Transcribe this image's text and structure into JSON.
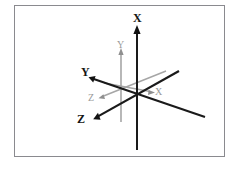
{
  "figure": {
    "background_color": "#ffffff",
    "frame": {
      "border_color": "#8a8a8f",
      "fill_color": "#ffffff"
    },
    "colors": {
      "primary_axis": "#151515",
      "secondary_axis": "#a6a6a6",
      "primary_label": "#151515",
      "secondary_label": "#9a9a9a"
    },
    "origin": {
      "x": 137,
      "y": 90
    },
    "frames": [
      {
        "name": "primary-frame",
        "style": "solid-black-bold",
        "axes": [
          {
            "label": "X",
            "label_x": 133,
            "label_y": 12,
            "direction": "up",
            "arrow_tip": {
              "x": 137,
              "y": 27
            },
            "tail": {
              "x": 137,
              "y": 150
            },
            "arrow": true
          },
          {
            "label": "Y",
            "label_x": 81,
            "label_y": 66,
            "direction": "upper-left",
            "arrow_tip": {
              "x": 90,
              "y": 78
            },
            "tail": {
              "x": 205,
              "y": 117
            },
            "arrow": true
          },
          {
            "label": "Z",
            "label_x": 77,
            "label_y": 114,
            "direction": "lower-left",
            "arrow_tip": {
              "x": 95,
              "y": 118
            },
            "tail": {
              "x": 178,
              "y": 72
            },
            "arrow": true
          }
        ]
      },
      {
        "name": "secondary-frame",
        "style": "solid-gray-thin",
        "axes": [
          {
            "label": "Y",
            "label_x": 116,
            "label_y": 39,
            "direction": "up",
            "arrow_tip": {
              "x": 121,
              "y": 51
            },
            "tail": {
              "x": 121,
              "y": 122
            },
            "arrow": true
          },
          {
            "label": "X",
            "label_x": 155,
            "label_y": 86,
            "direction": "lower-right",
            "arrow_tip": {
              "x": 152,
              "y": 92
            },
            "tail": {
              "x": 107,
              "y": 84
            },
            "arrow": true
          },
          {
            "label": "Z",
            "label_x": 88,
            "label_y": 93,
            "direction": "lower-left",
            "arrow_tip": {
              "x": 101,
              "y": 97
            },
            "tail": {
              "x": 165,
              "y": 72
            },
            "arrow": true
          }
        ]
      }
    ]
  }
}
